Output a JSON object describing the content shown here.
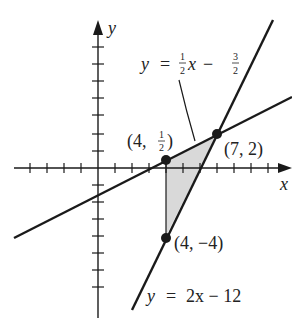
{
  "axes": {
    "x_label": "x",
    "y_label": "y",
    "origin_px": [
      98,
      168
    ],
    "unit_px": 17
  },
  "lines": [
    {
      "name": "line-half",
      "equation": {
        "lhs": "y",
        "eq": "=",
        "coef_num": "1",
        "coef_den": "2",
        "var": "x",
        "op": "−",
        "const_num": "3",
        "const_den": "2"
      },
      "slope": 0.5,
      "intercept": -1.5
    },
    {
      "name": "line-two",
      "equation": {
        "lhs": "y",
        "eq": "=",
        "rest": "2x − 12"
      },
      "slope": 2,
      "intercept": -12
    }
  ],
  "points": [
    {
      "label_open": "(4, ",
      "frac_num": "1",
      "frac_den": "2",
      "label_close": ")",
      "x": 4,
      "y": 0.5
    },
    {
      "label": "(7, 2)",
      "x": 7,
      "y": 2
    },
    {
      "label": "(4, −4)",
      "x": 4,
      "y": -4
    }
  ],
  "region": {
    "fill": "#d9d9d9",
    "vertices": [
      [
        4,
        0.5
      ],
      [
        7,
        2
      ],
      [
        4,
        -4
      ]
    ]
  },
  "colors": {
    "ink": "#1a1a1a",
    "shade": "#d9d9d9"
  }
}
